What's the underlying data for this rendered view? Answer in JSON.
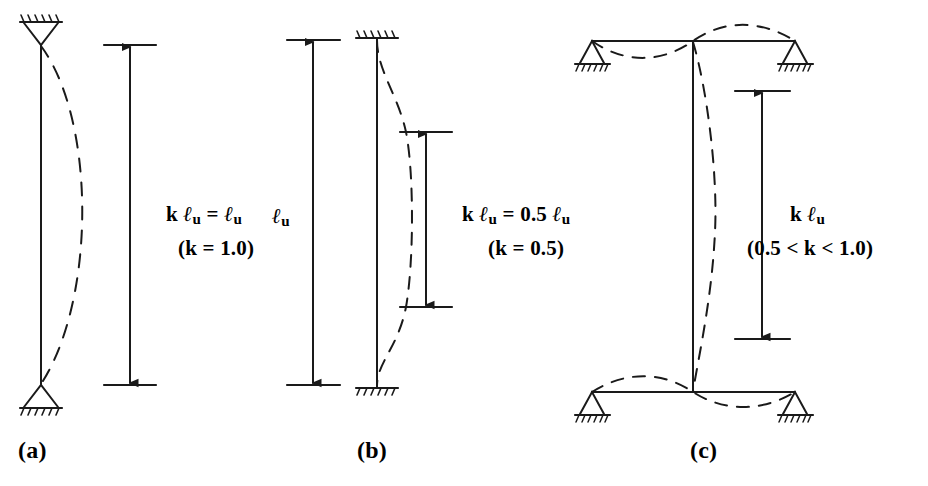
{
  "figure": {
    "ink_color": "#1a1a1a",
    "background_color": "#ffffff"
  },
  "panels": [
    {
      "id": "a",
      "tag": "(a)",
      "support_top": "pin",
      "support_bottom": "pin",
      "dimension_labels": [
        {
          "name": "k-lu-equation",
          "prefix": "k",
          "symbol": "ℓ",
          "subscript": "u",
          "equals": "=",
          "value_symbol": "ℓ",
          "value_subscript": "u",
          "text": "k ℓu = ℓu"
        },
        {
          "name": "k-value",
          "text": "(k = 1.0)"
        }
      ]
    },
    {
      "id": "b",
      "tag": "(b)",
      "support_top": "fixed",
      "support_bottom": "fixed",
      "dimension_labels": [
        {
          "name": "lu-label",
          "text": "ℓu"
        },
        {
          "name": "k-lu-equation",
          "text": "k ℓu = 0.5 ℓu"
        },
        {
          "name": "k-value",
          "text": "(k = 0.5)"
        }
      ]
    },
    {
      "id": "c",
      "tag": "(c)",
      "support_top": "pin",
      "support_bottom": "pin",
      "frame": "unbraced-sway",
      "dimension_labels": [
        {
          "name": "k-lu-label",
          "text": "k ℓu"
        },
        {
          "name": "k-range",
          "text": "(0.5 < k < 1.0)"
        }
      ]
    }
  ],
  "text": {
    "panel_a": {
      "k_prefix": "k",
      "ell": "ℓ",
      "sub_u": "u",
      "eq": "=",
      "k_value": "(k = 1.0)"
    },
    "panel_b": {
      "lu_ell": "ℓ",
      "lu_sub": "u",
      "k_prefix": "k",
      "eq_middle": "= 0.5",
      "k_value": "(k = 0.5)"
    },
    "panel_c": {
      "k_prefix": "k",
      "k_range": "(0.5 < k < 1.0)"
    },
    "tags": {
      "a": "(a)",
      "b": "(b)",
      "c": "(c)"
    }
  }
}
